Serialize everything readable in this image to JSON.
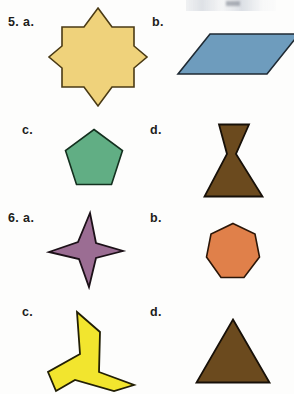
{
  "page": {
    "kind": "geometry-worksheet-shapes",
    "background_color": "#fefefe"
  },
  "problems": [
    {
      "number": "5. a.",
      "label": "5. a.",
      "shape_name": "eight-pointed-star",
      "fill_color": "#EFD27B",
      "stroke_color": "#4A3A14"
    },
    {
      "number": "b.",
      "label": "b.",
      "shape_name": "parallelogram",
      "fill_color": "#6E9CBD",
      "stroke_color": "#1F2A33"
    },
    {
      "number": "c.",
      "label": "c.",
      "shape_name": "pentagon",
      "fill_color": "#61AE84",
      "stroke_color": "#14301F"
    },
    {
      "number": "d.",
      "label": "d.",
      "shape_name": "concave-hexagon-hourglass",
      "fill_color": "#6B4A1E",
      "stroke_color": "#171008"
    },
    {
      "number": "6. a.",
      "label": "6. a.",
      "shape_name": "four-pointed-star",
      "fill_color": "#9B6D93",
      "stroke_color": "#1C1118"
    },
    {
      "number": "b.",
      "label": "b.",
      "shape_name": "heptagon",
      "fill_color": "#E0804A",
      "stroke_color": "#2B1608"
    },
    {
      "number": "c.",
      "label": "c.",
      "shape_name": "three-armed-pinwheel",
      "fill_color": "#F2E52E",
      "stroke_color": "#221F05"
    },
    {
      "number": "d.",
      "label": "d.",
      "shape_name": "triangle",
      "fill_color": "#6B4A1E",
      "stroke_color": "#171008"
    }
  ]
}
